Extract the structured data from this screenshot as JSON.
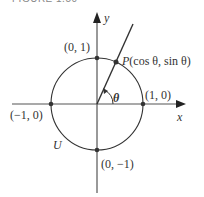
{
  "figure": {
    "caption": "FIGURE 1.50"
  },
  "diagram": {
    "type": "unit-circle",
    "axes": {
      "x_label": "x",
      "y_label": "y"
    },
    "circle_label": "U",
    "angle_label": "θ",
    "points": [
      {
        "id": "top",
        "label": "(0, 1)"
      },
      {
        "id": "right",
        "label": "(1, 0)"
      },
      {
        "id": "left",
        "label": "(−1, 0)"
      },
      {
        "id": "bottom",
        "label": "(0, −1)"
      },
      {
        "id": "P",
        "label_prefix": "P",
        "label_body": "(cos θ, sin θ)"
      }
    ],
    "colors": {
      "stroke": "#333333",
      "point": "#333333",
      "axis": "#555555"
    }
  }
}
